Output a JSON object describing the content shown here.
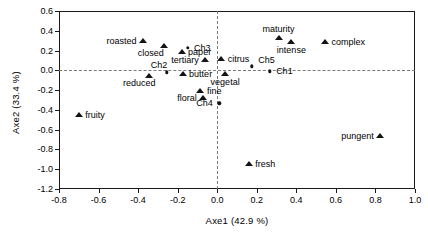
{
  "chart_data": {
    "type": "scatter",
    "title": "",
    "xlabel": "Axe1 (42.9 %)",
    "ylabel": "Axe2 (33.4 %)",
    "xlim": [
      -0.8,
      1.0
    ],
    "ylim": [
      -1.2,
      0.6
    ],
    "xticks": [
      "-0.8",
      "-0.6",
      "-0.4",
      "-0.2",
      "0.0",
      "0.2",
      "0.4",
      "0.6",
      "0.8",
      "1.0"
    ],
    "xtick_values": [
      -0.8,
      -0.6,
      -0.4,
      -0.2,
      0.0,
      0.2,
      0.4,
      0.6,
      0.8,
      1.0
    ],
    "yticks": [
      "0.6",
      "0.4",
      "0.2",
      "0.0",
      "-0.2",
      "-0.4",
      "-0.6",
      "-0.8",
      "-1.0",
      "-1.2"
    ],
    "ytick_values": [
      0.6,
      0.4,
      0.2,
      0.0,
      -0.2,
      -0.4,
      -0.6,
      -0.8,
      -1.0,
      -1.2
    ],
    "grid": false,
    "legend": "none",
    "reference_lines": {
      "horizontal": 0.0,
      "vertical": 0.0,
      "style": "dashed"
    },
    "marker_colors": {
      "descriptor": "#141414",
      "sample": "#141414"
    },
    "series": [
      {
        "name": "descriptors",
        "marker": "triangle",
        "points": [
          {
            "label": "roasted",
            "x": -0.375,
            "y": 0.295,
            "label_pos": "left"
          },
          {
            "label": "closed",
            "x": -0.27,
            "y": 0.25,
            "label_pos": "below-left"
          },
          {
            "label": "paper",
            "x": -0.18,
            "y": 0.19,
            "label_pos": "right"
          },
          {
            "label": "tertiary",
            "x": -0.06,
            "y": 0.105,
            "label_pos": "left"
          },
          {
            "label": "citrus",
            "x": 0.02,
            "y": 0.11,
            "label_pos": "right"
          },
          {
            "label": "maturity",
            "x": 0.31,
            "y": 0.33,
            "label_pos": "above"
          },
          {
            "label": "intense",
            "x": 0.375,
            "y": 0.285,
            "label_pos": "below"
          },
          {
            "label": "complex",
            "x": 0.545,
            "y": 0.285,
            "label_pos": "right"
          },
          {
            "label": "reduced",
            "x": -0.345,
            "y": -0.055,
            "label_pos": "below-left"
          },
          {
            "label": "butter",
            "x": -0.175,
            "y": -0.035,
            "label_pos": "right"
          },
          {
            "label": "vegetal",
            "x": 0.04,
            "y": -0.04,
            "label_pos": "below"
          },
          {
            "label": "fine",
            "x": -0.085,
            "y": -0.205,
            "label_pos": "right"
          },
          {
            "label": "floral",
            "x": -0.07,
            "y": -0.28,
            "label_pos": "left"
          },
          {
            "label": "fruity",
            "x": -0.7,
            "y": -0.455,
            "label_pos": "right"
          },
          {
            "label": "pungent",
            "x": 0.825,
            "y": -0.66,
            "label_pos": "left"
          },
          {
            "label": "fresh",
            "x": 0.16,
            "y": -0.95,
            "label_pos": "right"
          }
        ]
      },
      {
        "name": "samples",
        "marker": "dot",
        "points": [
          {
            "label": "Ch3",
            "x": -0.15,
            "y": 0.225,
            "label_pos": "right"
          },
          {
            "label": "Ch2",
            "x": -0.255,
            "y": -0.02,
            "label_pos": "above-left"
          },
          {
            "label": "Ch5",
            "x": 0.175,
            "y": 0.04,
            "label_pos": "above-right"
          },
          {
            "label": "Ch1",
            "x": 0.265,
            "y": -0.01,
            "label_pos": "right"
          },
          {
            "label": "Ch4",
            "x": 0.01,
            "y": -0.335,
            "label_pos": "left"
          }
        ]
      }
    ]
  }
}
